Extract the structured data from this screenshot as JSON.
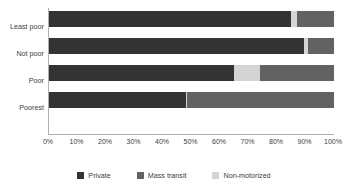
{
  "chart_data": {
    "type": "bar",
    "orientation": "horizontal",
    "stacked": true,
    "normalized_percent": true,
    "title": "",
    "subtitle": "",
    "xlabel": "",
    "ylabel": "",
    "xlim": [
      0,
      100
    ],
    "xticks": [
      0,
      10,
      20,
      30,
      40,
      50,
      60,
      70,
      80,
      90,
      100
    ],
    "xtick_labels": [
      "0%",
      "10%",
      "20%",
      "30%",
      "40%",
      "50%",
      "60%",
      "70%",
      "80%",
      "90%",
      "100%"
    ],
    "grid": false,
    "legend_position": "bottom",
    "categories": [
      "Least poor",
      "Not poor",
      "Poor",
      "Poorest"
    ],
    "stack_order": [
      "Private",
      "Non-motorized",
      "Mass transit"
    ],
    "series": [
      {
        "name": "Private",
        "color": "#333333",
        "values": [
          85,
          89.5,
          65,
          48
        ]
      },
      {
        "name": "Mass transit",
        "color": "#626262",
        "values": [
          13,
          9,
          26,
          51.5
        ]
      },
      {
        "name": "Non-motorized",
        "color": "#d4d4d4",
        "values": [
          2,
          1.5,
          9,
          0.5
        ]
      }
    ]
  },
  "legend": {
    "items": [
      {
        "label": "Private",
        "color": "#333333"
      },
      {
        "label": "Mass transit",
        "color": "#626262"
      },
      {
        "label": "Non-motorized",
        "color": "#d4d4d4"
      }
    ]
  },
  "axis": {
    "line_color": "#b0b0b0"
  }
}
